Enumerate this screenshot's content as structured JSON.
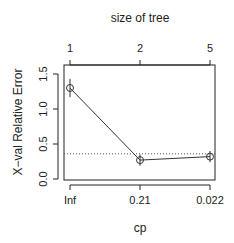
{
  "chart_data": {
    "type": "line",
    "title": "",
    "top_axis_label": "size of tree",
    "top_tick_labels": [
      "1",
      "2",
      "5"
    ],
    "xlabel": "cp",
    "ylabel": "X−val Relative Error",
    "categories": [
      "Inf",
      "0.21",
      "0.022"
    ],
    "y_tick_labels": [
      "0.0",
      "0.5",
      "1.0",
      "1.5"
    ],
    "y_ticks": [
      0.0,
      0.5,
      1.0,
      1.5
    ],
    "ylim": [
      0.0,
      1.6
    ],
    "series": [
      {
        "name": "xerror",
        "values": [
          1.3,
          0.27,
          0.32
        ],
        "error_low": [
          1.17,
          0.19,
          0.24
        ],
        "error_high": [
          1.43,
          0.35,
          0.4
        ]
      }
    ],
    "reference_line": {
      "y": 0.36,
      "style": "dotted"
    },
    "grid": false,
    "legend": null
  },
  "colors": {
    "line": "#333333",
    "axis": "#222222",
    "ref": "#555555"
  }
}
